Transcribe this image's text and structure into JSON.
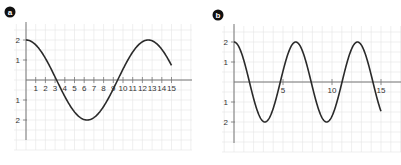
{
  "chart_data": [
    {
      "type": "line",
      "panel_label": "a",
      "title": "",
      "xlabel": "",
      "ylabel": "",
      "xlim": [
        0,
        16.5
      ],
      "ylim": [
        -3,
        3
      ],
      "grid": true,
      "x_ticks": [
        1,
        2,
        3,
        4,
        5,
        6,
        7,
        8,
        9,
        10,
        11,
        12,
        13,
        14,
        15
      ],
      "x_tick_labels": [
        "1",
        "2",
        "3",
        "4",
        "5",
        "6",
        "7",
        "8",
        "9",
        "10",
        "11",
        "12",
        "13",
        "14",
        "15"
      ],
      "y_ticks": [
        2,
        1,
        -1,
        -2
      ],
      "y_tick_labels": [
        "2",
        "1",
        "1",
        "2"
      ],
      "function": "2*cos(2*pi*x/12.6)",
      "series": [
        {
          "name": "curve",
          "x": [
            0,
            1,
            2,
            3,
            3.15,
            4,
            5,
            6,
            6.3,
            7,
            8,
            9,
            9.45,
            10,
            11,
            12,
            12.6,
            13,
            14,
            15
          ],
          "values": [
            2,
            1.75,
            1.05,
            0.13,
            0,
            -0.73,
            -1.46,
            -1.98,
            -2,
            -1.94,
            -1.46,
            -0.47,
            0,
            0.55,
            1.45,
            1.96,
            2,
            1.98,
            1.58,
            0.82
          ]
        }
      ]
    },
    {
      "type": "line",
      "panel_label": "b",
      "title": "",
      "xlabel": "",
      "ylabel": "",
      "xlim": [
        0,
        16.5
      ],
      "ylim": [
        -3,
        3
      ],
      "grid": true,
      "x_ticks": [
        5,
        10,
        15
      ],
      "x_tick_labels": [
        "5",
        "10",
        "15"
      ],
      "y_ticks": [
        2,
        1,
        -1,
        -2
      ],
      "y_tick_labels": [
        "2",
        "1",
        "1",
        "2"
      ],
      "function": "2*cos(2*pi*x/6.3)",
      "series": [
        {
          "name": "curve",
          "x": [
            0,
            1.575,
            3.15,
            4.725,
            6.3,
            7.875,
            9.45,
            11.025,
            12.6,
            14.175,
            15
          ],
          "values": [
            2,
            0,
            -2,
            0,
            2,
            0,
            -2,
            0,
            2,
            0,
            -1.6
          ]
        }
      ]
    }
  ],
  "panels": {
    "a": {
      "label": "a",
      "period": 12.6,
      "amplitude": 2
    },
    "b": {
      "label": "b",
      "period": 6.3,
      "amplitude": 2
    }
  },
  "colors": {
    "grid": "#e4e4e4",
    "axis": "#777777",
    "curve": "#2a2a2a",
    "badge": "#111111"
  }
}
